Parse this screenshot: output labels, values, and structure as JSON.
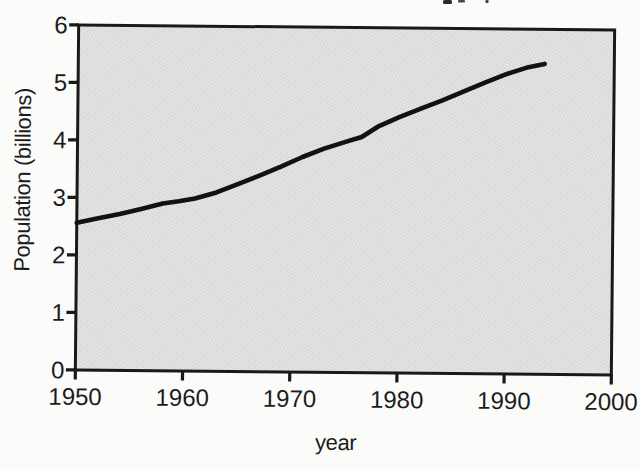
{
  "chart_data": {
    "type": "line",
    "title": "",
    "xlabel": "year",
    "ylabel": "Population (billions)",
    "xlim": [
      1950,
      2000
    ],
    "ylim": [
      0,
      6
    ],
    "xticks": [
      1950,
      1960,
      1970,
      1980,
      1990,
      2000
    ],
    "yticks": [
      0,
      1,
      2,
      3,
      4,
      5,
      6
    ],
    "grid": false,
    "legend": false,
    "plot_background": "stippled-halftone-gray",
    "series": [
      {
        "name": "Population",
        "x": [
          1950,
          1952,
          1954,
          1956,
          1958,
          1959.5,
          1961,
          1963,
          1965,
          1967,
          1969,
          1971,
          1973,
          1975,
          1976.5,
          1978,
          1980,
          1982,
          1984,
          1986,
          1988,
          1990,
          1992,
          1993.5
        ],
        "y": [
          2.56,
          2.64,
          2.72,
          2.81,
          2.91,
          2.95,
          3.0,
          3.11,
          3.26,
          3.41,
          3.57,
          3.74,
          3.89,
          4.01,
          4.1,
          4.28,
          4.45,
          4.6,
          4.75,
          4.91,
          5.07,
          5.22,
          5.34,
          5.4
        ]
      }
    ]
  },
  "colors": {
    "page_bg": "#fbfbfa",
    "line": "#121212",
    "frame": "#191919",
    "tick": "#191919",
    "text": "#1c1c1c",
    "plot_fill_base": "#e4e4e2",
    "plot_fill_dot": "#c8c8c6"
  },
  "layout_notes": {
    "scan_skew_deg": 0.55
  }
}
